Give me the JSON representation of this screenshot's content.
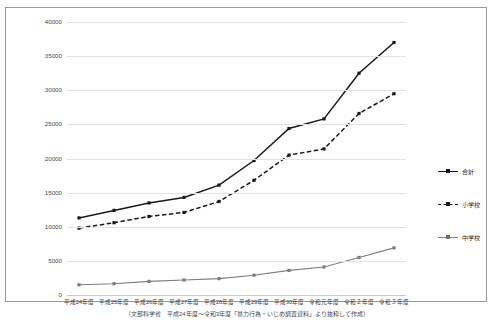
{
  "chart_data": {
    "type": "line",
    "title": "",
    "xlabel": "",
    "ylabel": "",
    "ylim": [
      0,
      40000
    ],
    "yticks": [
      0,
      5000,
      10000,
      15000,
      20000,
      25000,
      30000,
      35000,
      40000
    ],
    "ytick_labels": [
      "0",
      "5000",
      "10000",
      "15000",
      "20000",
      "25000",
      "30000",
      "35000",
      "40000"
    ],
    "grid": true,
    "legend_position": "right",
    "categories": [
      "平成24年度",
      "平成25年度",
      "平成26年度",
      "平成27年度",
      "平成28年度",
      "平成29年度",
      "平成30年度",
      "令和元年度",
      "令和２年度",
      "令和３年度"
    ],
    "series": [
      {
        "name": "合計",
        "style": "solid",
        "color": "#1a1a1a",
        "values": [
          11300,
          12400,
          13500,
          14300,
          16100,
          19700,
          24400,
          25800,
          32500,
          37000
        ]
      },
      {
        "name": "小学校",
        "style": "dashed",
        "color": "#1a1a1a",
        "values": [
          9800,
          10600,
          11500,
          12100,
          13700,
          16800,
          20500,
          21400,
          26600,
          29500
        ]
      },
      {
        "name": "中学校",
        "style": "solid",
        "color": "#7d7d7d",
        "values": [
          1500,
          1650,
          2000,
          2200,
          2400,
          2900,
          3600,
          4100,
          5500,
          6900
        ]
      }
    ]
  },
  "legend": {
    "items": [
      {
        "label": "合計"
      },
      {
        "label": "小学校"
      },
      {
        "label": "中学校"
      }
    ]
  },
  "footnote": {
    "text": "（文部科学省　平成24年度～令和3年度「暴力行為・いじめ調査資料」より抜粋して作成）"
  }
}
